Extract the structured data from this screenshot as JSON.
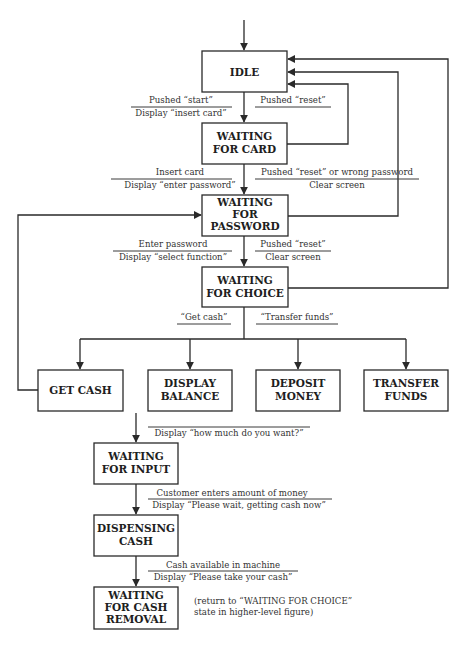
{
  "colors": {
    "stroke": "#2a2a2a",
    "text": "#1e1e1e",
    "background": "#ffffff"
  },
  "states": {
    "idle": [
      "IDLE"
    ],
    "waiting_card": [
      "WAITING",
      "FOR CARD"
    ],
    "waiting_password": [
      "WAITING",
      "FOR",
      "PASSWORD"
    ],
    "waiting_choice": [
      "WAITING",
      "FOR CHOICE"
    ],
    "get_cash": [
      "GET CASH"
    ],
    "display_balance": [
      "DISPLAY",
      "BALANCE"
    ],
    "deposit_money": [
      "DEPOSIT",
      "MONEY"
    ],
    "transfer_funds": [
      "TRANSFER",
      "FUNDS"
    ],
    "waiting_input": [
      "WAITING",
      "FOR INPUT"
    ],
    "dispensing_cash": [
      "DISPENSING",
      "CASH"
    ],
    "waiting_removal": [
      "WAITING",
      "FOR CASH",
      "REMOVAL"
    ]
  },
  "transitions": {
    "idle_to_card": {
      "event": "Pushed “start”",
      "action": "Display “insert card”"
    },
    "card_reset": {
      "event": "Pushed “reset”",
      "action": ""
    },
    "card_to_password": {
      "event": "Insert card",
      "action": "Display “enter password”"
    },
    "password_reset": {
      "event": "Pushed “reset” or wrong password",
      "action": "Clear screen"
    },
    "password_to_choice": {
      "event": "Enter password",
      "action": "Display “select function”"
    },
    "choice_reset": {
      "event": "Pushed “reset”",
      "action": "Clear screen"
    },
    "choice_get_cash": {
      "event": "“Get cash”"
    },
    "choice_transfer": {
      "event": "“Transfer funds”"
    },
    "cash_to_input": {
      "event": "",
      "action": "Display “how much do you want?”"
    },
    "input_to_dispensing": {
      "event": "Customer enters amount of money",
      "action": "Display “Please wait, getting cash now”"
    },
    "dispensing_to_removal": {
      "event": "Cash available in machine",
      "action": "Display “Please take your cash”"
    }
  },
  "note": [
    "(return to “WAITING FOR CHOICE”",
    "state in higher-level figure)"
  ]
}
